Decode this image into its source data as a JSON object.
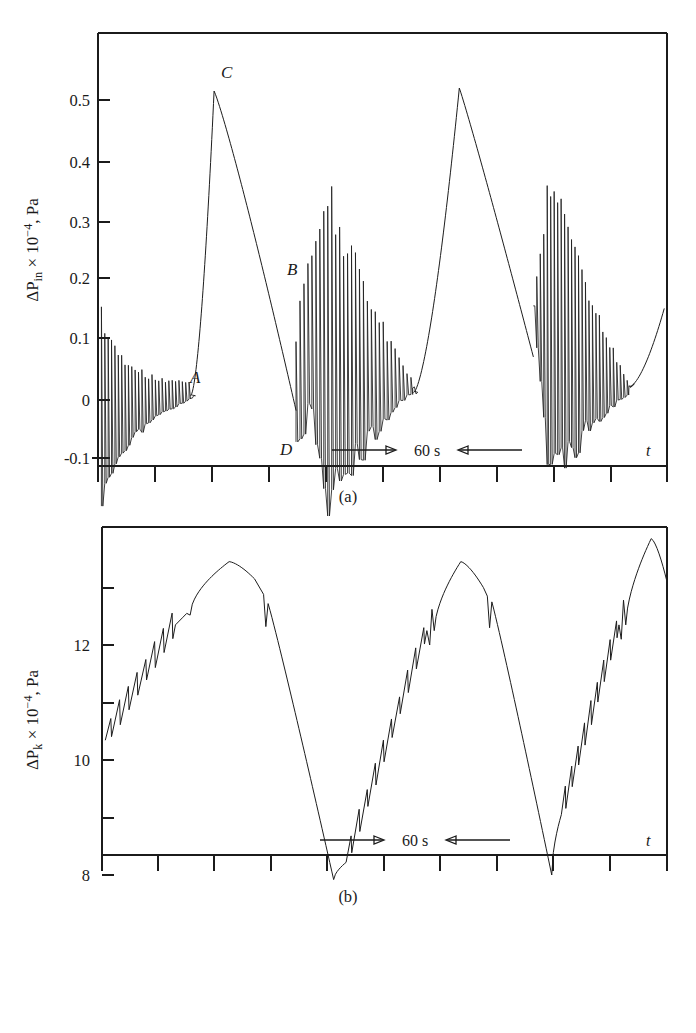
{
  "figure": {
    "panels": [
      {
        "id": "a",
        "caption": "(a)",
        "x_axis_label": "t",
        "scale_bar_label": "60 s",
        "y_axis_title_parts": {
          "delta_p": "ΔP",
          "subscript": "in",
          "times": " × 10",
          "exponent": "−4",
          "units": ", Pa"
        },
        "y_axis_title_plain": "ΔP_in × 10⁻⁴, Pa"
      },
      {
        "id": "b",
        "caption": "(b)",
        "x_axis_label": "t",
        "scale_bar_label": "60 s",
        "y_axis_title_parts": {
          "delta_p": "ΔP",
          "subscript": "k",
          "times": " × 10",
          "exponent": "−4",
          "units": ", Pa"
        },
        "y_axis_title_plain": "ΔP_k × 10⁻⁴, Pa"
      }
    ]
  },
  "chart_data": [
    {
      "type": "line",
      "id": "panel-a",
      "title": "",
      "subtitle": "(a)",
      "xlabel": "t",
      "ylabel": "ΔP_in × 10⁻⁴, Pa",
      "ylim": [
        -0.13,
        0.57
      ],
      "xlim": [
        0,
        100
      ],
      "grid": false,
      "legend": null,
      "y_ticks": [
        0.5,
        0.4,
        0.3,
        0.2,
        0.1,
        0,
        -0.1
      ],
      "y_tick_labels": [
        "0.5",
        "0.4",
        "0.3",
        "0.2",
        "0.1",
        "0",
        "-0.1"
      ],
      "x_tick_count": 11,
      "x_tick_labels": [],
      "annotations": [
        {
          "label": "A",
          "x": 15.8,
          "y": 0.045,
          "note": "end of first decaying oscillation burst, just before steep rise"
        },
        {
          "label": "C",
          "x": 20.6,
          "y": 0.555,
          "note": "sharp peak of first large relaxation cycle, peak value ~0.515"
        },
        {
          "label": "B",
          "x": 41.0,
          "y": 0.215,
          "note": "on the descending ramp entering second burst"
        },
        {
          "label": "D",
          "x": 35.6,
          "y": -0.105,
          "note": "deepest negative downspike of second burst, ~-0.075"
        }
      ],
      "scale_bar": {
        "label": "60 s",
        "x_start": 41.5,
        "x_end": 70.5,
        "y": -0.092
      },
      "series": [
        {
          "name": "ΔP_in",
          "description": "Three relaxation cycles; each starts with a dense decaying oscillation burst then a steep rise to a sharp peak followed by a slow concave decay.",
          "features": {
            "burst_1": {
              "x_start": 0.6,
              "x_end": 16.0,
              "amp_start": 0.32,
              "amp_end": 0.02,
              "baseline_start": -0.08,
              "baseline_end": 0.01,
              "cycles": 26
            },
            "rise_1": {
              "x_start": 16.3,
              "x_end": 20.4,
              "y_start": 0.005,
              "y_end": 0.515
            },
            "decay_1": {
              "x_start": 20.4,
              "x_end": 34.8,
              "y_start": 0.515,
              "y_end": -0.02
            },
            "burst_2": {
              "x_start": 34.8,
              "x_end": 55.0,
              "amp_peak": 0.39,
              "amp_end": 0.03,
              "baseline_low": -0.075,
              "cycles": 27
            },
            "rise_2": {
              "x_start": 55.5,
              "x_end": 63.5,
              "y_start": 0.01,
              "y_end": 0.52
            },
            "decay_2": {
              "x_start": 63.5,
              "x_end": 76.5,
              "y_start": 0.52,
              "y_end": 0.07
            },
            "burst_3": {
              "x_start": 76.5,
              "x_end": 93.0,
              "amp_peak": 0.4,
              "amp_end": 0.03,
              "baseline_low": -0.055,
              "cycles": 26
            },
            "rise_3": {
              "x_start": 93.5,
              "x_end": 99.5,
              "y_start": 0.02,
              "y_end": 0.15
            }
          },
          "approx_peaks": [
            0.32,
            0.515,
            0.39,
            0.52,
            0.4
          ],
          "approx_troughs": [
            -0.08,
            -0.02,
            -0.075,
            0.01,
            -0.055
          ]
        }
      ]
    },
    {
      "type": "line",
      "id": "panel-b",
      "title": "",
      "subtitle": "(b)",
      "xlabel": "t",
      "ylabel": "ΔP_k × 10⁻⁴, Pa",
      "ylim": [
        7.0,
        14.6
      ],
      "xlim": [
        0,
        100
      ],
      "grid": false,
      "legend": null,
      "y_ticks": [
        13,
        12,
        11,
        10,
        9,
        8
      ],
      "y_tick_labels": [
        "",
        "12",
        "",
        "10",
        "",
        "8"
      ],
      "y_labeled_ticks": [
        12,
        10,
        8
      ],
      "y_minor_ticks": [
        13,
        11,
        9
      ],
      "x_tick_count": 11,
      "x_tick_labels": [],
      "annotations": [],
      "scale_bar": {
        "label": "60 s",
        "x_start": 41.5,
        "x_end": 70.5,
        "y": 8.42
      },
      "series": [
        {
          "name": "ΔP_k",
          "description": "Three slow saw-modulated rise-and-fall cycles: sawtooth ripples on the rising limb, smooth rounded maximum, small notch, then smooth steep fall to a rounded minimum.",
          "features": {
            "cycle_1": {
              "start_x": 0.5,
              "start_y": 10.35,
              "ripple_end_x": 13.0,
              "peak_x": 22.5,
              "peak_y": 13.45,
              "notch_x": 29.5,
              "notch_y": 12.4,
              "min_x": 41.0,
              "min_y": 7.9
            },
            "cycle_2": {
              "ripple_start_x": 44.0,
              "ripple_start_y": 8.45,
              "ripple_end_x": 58.0,
              "peak_x": 63.5,
              "peak_y": 13.45,
              "notch_x": 68.5,
              "notch_y": 12.45,
              "min_x": 79.5,
              "min_y": 8.0
            },
            "cycle_3": {
              "ripple_start_x": 81.5,
              "ripple_start_y": 9.3,
              "ripple_end_x": 91.0,
              "peak_x": 97.0,
              "peak_y": 13.85,
              "end_x": 100,
              "end_y": 13.1
            }
          },
          "approx_peaks": [
            13.45,
            13.45,
            13.85
          ],
          "approx_troughs": [
            7.9,
            8.0
          ]
        }
      ]
    }
  ]
}
